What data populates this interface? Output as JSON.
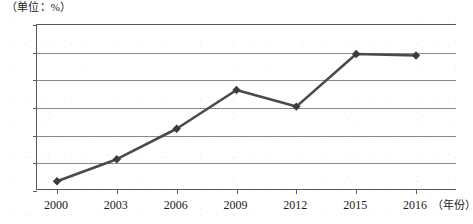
{
  "chart_data": {
    "type": "line",
    "title": "",
    "subtitle": "",
    "unit_note": "（单位：%）",
    "xlabel": "（年份）",
    "ylabel": "",
    "categories": [
      "2000",
      "2003",
      "2006",
      "2009",
      "2012",
      "2015",
      "2016"
    ],
    "values": [
      0.35,
      1.15,
      2.25,
      3.65,
      3.05,
      4.95,
      4.9
    ],
    "series": [
      {
        "name": "比重",
        "values": [
          0.35,
          1.15,
          2.25,
          3.65,
          3.05,
          4.95,
          4.9
        ]
      }
    ],
    "ylim": [
      0,
      6
    ],
    "yticks": [
      0,
      1,
      2,
      3,
      4,
      5,
      6
    ],
    "ytick_labels": [
      "0",
      "1",
      "2",
      "3",
      "4",
      "5",
      "6"
    ],
    "grid": true,
    "grid_axis": "y",
    "legend": "none",
    "marker": "diamond",
    "line_color": "#4a4a4a",
    "marker_color": "#3c3c3c",
    "grid_color": "#8a8a8a",
    "axis_color": "#595959"
  },
  "axis": {
    "x_tick_marks": [
      0,
      1,
      2,
      3,
      4,
      5,
      6
    ],
    "x_title": "（年份）"
  }
}
